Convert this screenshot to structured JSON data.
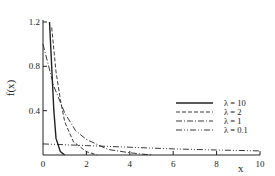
{
  "chart_data": {
    "type": "line",
    "title": "",
    "xlabel": "x",
    "ylabel": "f(x)",
    "xlim": [
      0,
      10
    ],
    "ylim": [
      0,
      1.2
    ],
    "xticks": [
      "0",
      "2",
      "4",
      "6",
      "8",
      "10"
    ],
    "yticks": [
      "0.4",
      "0.8",
      "1.2"
    ],
    "grid": false,
    "legend_position": "right-middle",
    "series": [
      {
        "name": "λ = 10",
        "style": "solid",
        "function": "exponential pdf starting at x≈0.3, steep decay",
        "x": [
          0.3,
          0.4,
          0.5,
          0.6,
          0.8,
          1.0
        ],
        "y": [
          1.2,
          0.8,
          0.4,
          0.15,
          0.03,
          0.0
        ]
      },
      {
        "name": "λ = 2",
        "style": "dashed",
        "x": [
          0.4,
          0.6,
          0.8,
          1.0,
          1.4,
          2.0,
          2.5
        ],
        "y": [
          1.15,
          0.75,
          0.5,
          0.3,
          0.12,
          0.03,
          0.0
        ]
      },
      {
        "name": "λ = 1",
        "style": "dash-dot",
        "x": [
          0,
          0.5,
          1.0,
          1.5,
          2.0,
          3.0,
          4.0,
          5.0
        ],
        "y": [
          1.0,
          0.62,
          0.38,
          0.22,
          0.14,
          0.05,
          0.02,
          0.0
        ]
      },
      {
        "name": "λ = 0.1",
        "style": "dash-dot-dot",
        "x": [
          0,
          2,
          4,
          6,
          8,
          10
        ],
        "y": [
          0.1,
          0.085,
          0.07,
          0.055,
          0.045,
          0.037
        ]
      }
    ]
  }
}
